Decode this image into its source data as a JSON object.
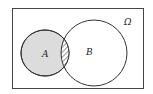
{
  "diagram": {
    "type": "venn",
    "universe_label": "Ω",
    "sets": [
      {
        "label": "A",
        "fill": "#dcdcdc"
      },
      {
        "label": "B",
        "fill": "#ffffff"
      }
    ],
    "intersection": {
      "pattern": "diagonal-hatch"
    },
    "colors": {
      "stroke": "#333333",
      "shade": "#dcdcdc",
      "background": "#ffffff"
    }
  }
}
